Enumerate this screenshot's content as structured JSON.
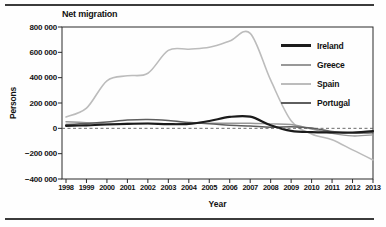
{
  "chart_data": {
    "type": "line",
    "title": "Net migration",
    "xlabel": "Year",
    "ylabel": "Persons",
    "x": [
      1998,
      1999,
      2000,
      2001,
      2002,
      2003,
      2004,
      2005,
      2006,
      2007,
      2008,
      2009,
      2010,
      2011,
      2012,
      2013
    ],
    "ylim": [
      -400000,
      800000
    ],
    "yticks": [
      800000,
      600000,
      400000,
      200000,
      0,
      -200000,
      -400000
    ],
    "ytick_labels": [
      "800 000",
      "600 000",
      "400 000",
      "200 000",
      "0",
      "−200 000",
      "−400 000"
    ],
    "grid": false,
    "zero_line_style": "dashed",
    "legend_position": "upper-right",
    "axis_color": "#2a2a2a",
    "series": [
      {
        "name": "Ireland",
        "color": "#1b1b1b",
        "width": 2.2,
        "values": [
          20000,
          24000,
          30000,
          35000,
          38000,
          33000,
          35000,
          58000,
          90000,
          92000,
          25000,
          -20000,
          -30000,
          -33000,
          -33000,
          -22000
        ]
      },
      {
        "name": "Greece",
        "color": "#989898",
        "width": 1.4,
        "values": [
          52000,
          45000,
          35000,
          38000,
          38000,
          36000,
          40000,
          40000,
          40000,
          40000,
          35000,
          30000,
          -5000,
          -40000,
          -60000,
          -52000
        ]
      },
      {
        "name": "Spain",
        "color": "#bcbcbc",
        "width": 1.6,
        "values": [
          90000,
          160000,
          375000,
          415000,
          435000,
          615000,
          625000,
          640000,
          690000,
          750000,
          380000,
          60000,
          -45000,
          -90000,
          -170000,
          -250000
        ]
      },
      {
        "name": "Portugal",
        "color": "#5e5e5e",
        "width": 1.5,
        "values": [
          30000,
          38000,
          50000,
          65000,
          70000,
          62000,
          47000,
          36000,
          25000,
          18000,
          9000,
          13000,
          3000,
          -25000,
          -37000,
          -35000
        ]
      }
    ]
  }
}
